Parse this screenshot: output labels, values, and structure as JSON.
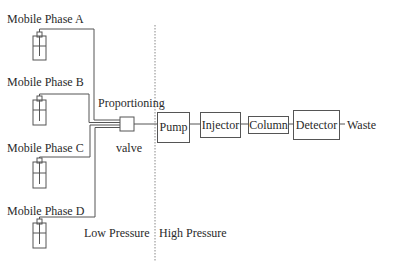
{
  "diagram": {
    "type": "HPLC system schematic",
    "mobile_phases": [
      {
        "label": "Mobile Phase A"
      },
      {
        "label": "Mobile Phase B"
      },
      {
        "label": "Mobile Phase C"
      },
      {
        "label": "Mobile Phase D"
      }
    ],
    "valve": {
      "label_top": "Proportioning",
      "label_bottom": "valve"
    },
    "components": [
      {
        "label": "Pump"
      },
      {
        "label": "Injector"
      },
      {
        "label": "Column"
      },
      {
        "label": "Detector"
      }
    ],
    "outlet": {
      "label": "Waste"
    },
    "zones": {
      "low": "Low Pressure",
      "high": "High Pressure"
    },
    "colors": {
      "line": "#555555",
      "text": "#2a2a2a",
      "divider": "#888888"
    }
  }
}
